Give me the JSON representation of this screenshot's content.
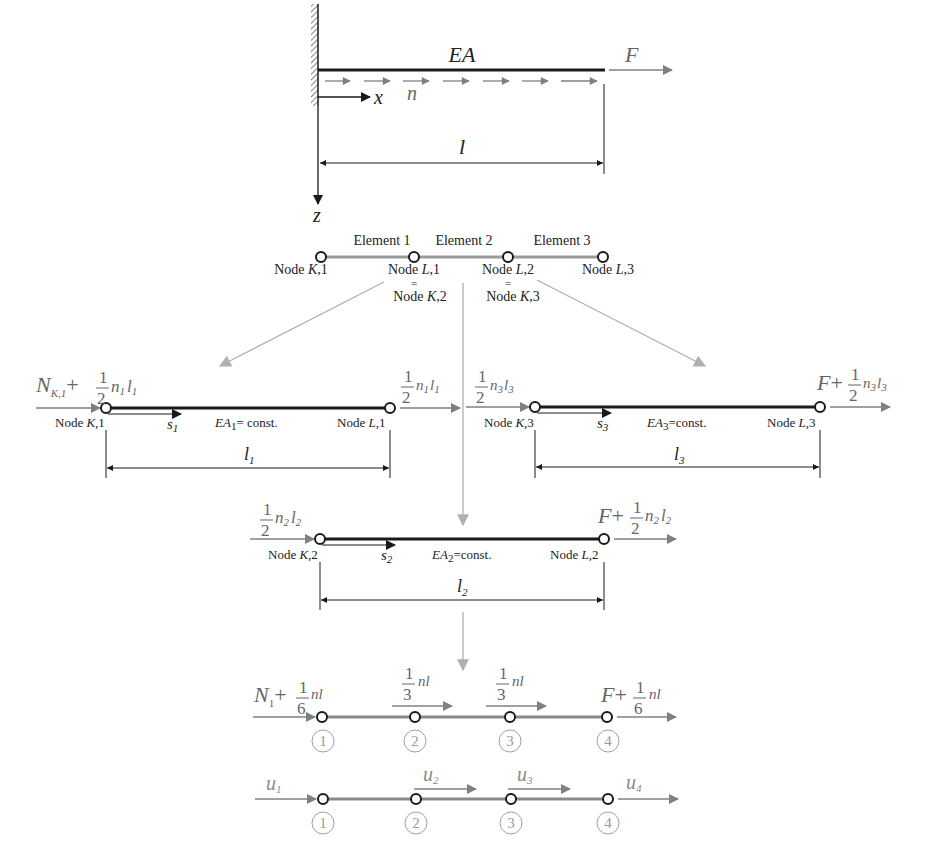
{
  "colors": {
    "beam": "#1a1a1a",
    "grey_beam": "#8a8a8a",
    "load_arrow": "#808080",
    "connector": "#b0b0b0",
    "text_dark": "#222222",
    "text_grey": "#666666",
    "node_numbers": "#9a9a9a"
  },
  "top_beam": {
    "stiffness_label": "EA",
    "force_label": "F",
    "distributed_load_label": "n",
    "x_axis_label": "x",
    "z_axis_label": "z",
    "length_label": "l"
  },
  "element_strip": {
    "elements": [
      "Element 1",
      "Element 2",
      "Element 3"
    ],
    "nodes": [
      {
        "prefix": "Node ",
        "letter": "K",
        "suffix": ",1"
      },
      {
        "prefix": "Node ",
        "letter": "L",
        "suffix": ",1"
      },
      {
        "prefix": "Node ",
        "letter": "L",
        "suffix": ",2"
      },
      {
        "prefix": "Node ",
        "letter": "L",
        "suffix": ",3"
      }
    ],
    "equal_sign": "=",
    "shared_nodes": [
      {
        "prefix": "Node ",
        "letter": "K",
        "suffix": ",2"
      },
      {
        "prefix": "Node ",
        "letter": "K",
        "suffix": ",3"
      }
    ]
  },
  "element_1": {
    "left_load": {
      "main": "N",
      "main_sub": "K,1",
      "plus": "+",
      "num": "1",
      "den": "2",
      "tail_a": "n",
      "tail_a_sub": "1",
      "tail_b": "l",
      "tail_b_sub": "1"
    },
    "right_load": {
      "num": "1",
      "den": "2",
      "tail_a": "n",
      "tail_a_sub": "1",
      "tail_b": "l",
      "tail_b_sub": "1"
    },
    "left_node": {
      "prefix": "Node ",
      "letter": "K",
      "suffix": ",1"
    },
    "right_node": {
      "prefix": "Node ",
      "letter": "L",
      "suffix": ",1"
    },
    "local_axis": {
      "main": "s",
      "sub": "1"
    },
    "stiffness": {
      "main": "EA",
      "sub": "1",
      "rest": "= const."
    },
    "length": {
      "main": "l",
      "sub": "1"
    }
  },
  "element_2": {
    "left_load": {
      "num": "1",
      "den": "2",
      "tail_a": "n",
      "tail_a_sub": "2",
      "tail_b": "l",
      "tail_b_sub": "2"
    },
    "right_load": {
      "main": "F",
      "plus": "+",
      "num": "1",
      "den": "2",
      "tail_a": "n",
      "tail_a_sub": "2",
      "tail_b": "l",
      "tail_b_sub": "2"
    },
    "left_node": {
      "prefix": "Node ",
      "letter": "K",
      "suffix": ",2"
    },
    "right_node": {
      "prefix": "Node ",
      "letter": "L",
      "suffix": ",2"
    },
    "local_axis": {
      "main": "s",
      "sub": "2"
    },
    "stiffness": {
      "main": "EA",
      "sub": "2",
      "rest": "=const."
    },
    "length": {
      "main": "l",
      "sub": "2"
    }
  },
  "element_3": {
    "left_load": {
      "num": "1",
      "den": "2",
      "tail_a": "n",
      "tail_a_sub": "3",
      "tail_b": "l",
      "tail_b_sub": "3"
    },
    "right_load": {
      "main": "F",
      "plus": "+",
      "num": "1",
      "den": "2",
      "tail_a": "n",
      "tail_a_sub": "3",
      "tail_b": "l",
      "tail_b_sub": "3"
    },
    "left_node": {
      "prefix": "Node ",
      "letter": "K",
      "suffix": ",3"
    },
    "right_node": {
      "prefix": "Node ",
      "letter": "L",
      "suffix": ",3"
    },
    "local_axis": {
      "main": "s",
      "sub": "3"
    },
    "stiffness": {
      "main": "EA",
      "sub": "3",
      "rest": "=const."
    },
    "length": {
      "main": "l",
      "sub": "3"
    }
  },
  "assembled_loads": {
    "node_1": {
      "main": "N",
      "main_sub": "1",
      "plus": "+",
      "num": "1",
      "den": "6",
      "tail": "nl"
    },
    "node_2": {
      "num": "1",
      "den": "3",
      "tail": "nl"
    },
    "node_3": {
      "num": "1",
      "den": "3",
      "tail": "nl"
    },
    "node_4": {
      "main": "F",
      "plus": "+",
      "num": "1",
      "den": "6",
      "tail": "nl"
    },
    "node_numbers": [
      "1",
      "2",
      "3",
      "4"
    ]
  },
  "displacements": {
    "labels": [
      {
        "main": "u",
        "sub": "1"
      },
      {
        "main": "u",
        "sub": "2"
      },
      {
        "main": "u",
        "sub": "3"
      },
      {
        "main": "u",
        "sub": "4"
      }
    ],
    "node_numbers": [
      "1",
      "2",
      "3",
      "4"
    ]
  }
}
